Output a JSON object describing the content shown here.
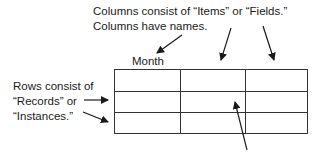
{
  "annotations": {
    "columns_line1": "Columns consist of “Items” or “Fields.”",
    "columns_line2": "Columns have names.",
    "column_name": "Month",
    "rows_line1": "Rows consist of",
    "rows_line2": "“Records” or",
    "rows_line3": "“Instances.”"
  },
  "table": {
    "columns": 3,
    "rows": 3,
    "header_label": "Month"
  },
  "colors": {
    "line": "#333333",
    "text": "#1a1a1a",
    "background": "#ffffff"
  }
}
